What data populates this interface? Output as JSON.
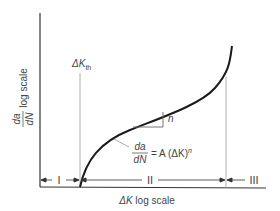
{
  "diagram": {
    "y_axis": {
      "label_fraction_numerator": "da",
      "label_fraction_denominator": "dN",
      "label_suffix": "log scale"
    },
    "x_axis": {
      "label_symbol": "ΔK",
      "label_suffix": "log scale"
    },
    "threshold": {
      "label_main": "ΔK",
      "label_sub": "th"
    },
    "slope_label": "n",
    "equation": {
      "numerator": "da",
      "denominator": "dN",
      "rhs": "= A (ΔK)",
      "exponent": "n"
    },
    "regions": [
      {
        "label": "I"
      },
      {
        "label": "II"
      },
      {
        "label": "III"
      }
    ],
    "colors": {
      "curve": "#1a1a1a",
      "axis": "#333333",
      "guide": "#888888",
      "text": "#444444"
    }
  }
}
